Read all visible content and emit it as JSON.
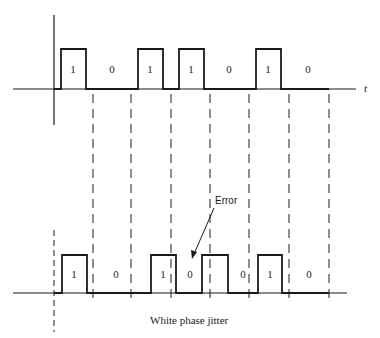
{
  "diagram": {
    "axis_label": "t",
    "caption": "White phase jitter",
    "error_label": "Error",
    "colors": {
      "ink": "#1a1a1a",
      "background": "#ffffff"
    },
    "top_waveform": {
      "bits": [
        "1",
        "0",
        "1",
        "1",
        "0",
        "1",
        "0"
      ],
      "pulses": [
        {
          "x0": 61,
          "x1": 86
        },
        {
          "x0": 138,
          "x1": 163
        },
        {
          "x0": 179,
          "x1": 204
        },
        {
          "x0": 256,
          "x1": 281
        }
      ]
    },
    "bottom_waveform": {
      "bits": [
        "1",
        "0",
        "1",
        "0",
        "0",
        "1",
        "0"
      ],
      "pulses": [
        {
          "x0": 62,
          "x1": 87
        },
        {
          "x0": 151,
          "x1": 176
        },
        {
          "x0": 202,
          "x1": 228
        },
        {
          "x0": 258,
          "x1": 282
        }
      ]
    },
    "bit_labels_top": [
      {
        "text": "1",
        "x": 73
      },
      {
        "text": "0",
        "x": 112
      },
      {
        "text": "1",
        "x": 150
      },
      {
        "text": "1",
        "x": 191
      },
      {
        "text": "0",
        "x": 229
      },
      {
        "text": "1",
        "x": 268
      },
      {
        "text": "0",
        "x": 308
      }
    ],
    "bit_labels_bottom": [
      {
        "text": "1",
        "x": 74
      },
      {
        "text": "0",
        "x": 116
      },
      {
        "text": "1",
        "x": 163
      },
      {
        "text": "0",
        "x": 190
      },
      {
        "text": "0",
        "x": 243
      },
      {
        "text": "1",
        "x": 270
      },
      {
        "text": "0",
        "x": 309
      }
    ],
    "clock_boundaries_x": [
      93,
      131,
      171,
      210,
      249,
      289,
      329
    ]
  }
}
